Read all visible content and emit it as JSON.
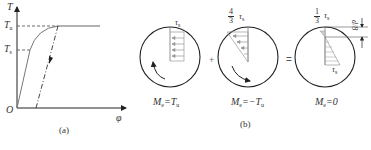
{
  "panel_a": {
    "caption": "(a)",
    "y_axis_label": "T",
    "x_axis_label": "φ",
    "origin_label": "O",
    "tick_labels": [
      {
        "main": "T",
        "sub": "u"
      },
      {
        "main": "T",
        "sub": "s"
      }
    ]
  },
  "panel_b": {
    "caption": "(b)",
    "operators": [
      "+",
      "="
    ],
    "circles": [
      {
        "stress_label": {
          "main": "τ",
          "sub": "s"
        },
        "moment_label": {
          "main": "M",
          "sub": "e",
          "eq": "=T",
          "eq_sub": "u"
        },
        "rotation": "counterclockwise"
      },
      {
        "stress_label": {
          "frac_num": "4",
          "frac_den": "3",
          "main": "τ",
          "sub": "s"
        },
        "moment_label": {
          "main": "M",
          "sub": "e",
          "eq": "=−T",
          "eq_sub": "u"
        },
        "rotation": "clockwise"
      },
      {
        "stress_label": {
          "frac_num": "1",
          "frac_den": "3",
          "main": "τ",
          "sub": "s"
        },
        "stress_label_bottom": {
          "main": "τ",
          "sub": "s"
        },
        "moment_label": {
          "main": "M",
          "sub": "e",
          "eq": "=0"
        },
        "dimension_label": "d/8"
      }
    ]
  }
}
